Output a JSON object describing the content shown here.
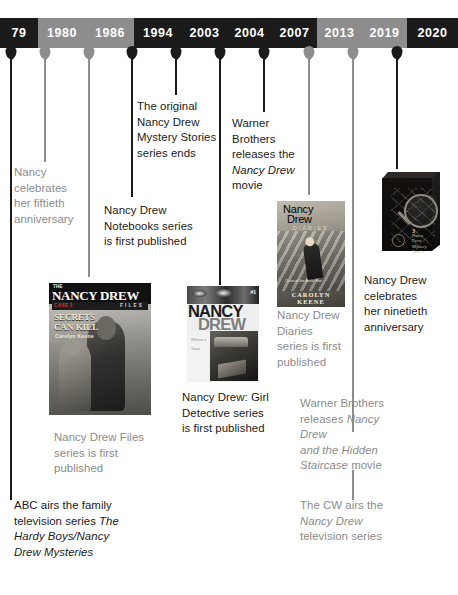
{
  "timeline": {
    "years": [
      {
        "label": "79",
        "style": "dark",
        "width": 38
      },
      {
        "label": "1980",
        "style": "gray",
        "width": 48
      },
      {
        "label": "1986",
        "style": "gray",
        "width": 48
      },
      {
        "label": "1994",
        "style": "dark",
        "width": 48
      },
      {
        "label": "2003",
        "style": "dark",
        "width": 45
      },
      {
        "label": "2004",
        "style": "dark",
        "width": 45
      },
      {
        "label": "2007",
        "style": "dark",
        "width": 45
      },
      {
        "label": "2013",
        "style": "gray",
        "width": 45
      },
      {
        "label": "2019",
        "style": "gray",
        "width": 45
      },
      {
        "label": "2020",
        "style": "dark",
        "width": 51
      }
    ],
    "markers": [
      {
        "year": "79",
        "x": 11,
        "style": "dark",
        "line_length": 443
      },
      {
        "year": "1980",
        "x": 45,
        "style": "gray",
        "line_length": 105
      },
      {
        "year": "1986",
        "x": 89,
        "style": "gray",
        "line_length": 220
      },
      {
        "year": "1994",
        "x": 132,
        "style": "dark",
        "line_length": 140
      },
      {
        "year": "2003",
        "x": 176,
        "style": "dark",
        "line_length": 38
      },
      {
        "year": "2004",
        "x": 220,
        "style": "dark",
        "line_length": 228
      },
      {
        "year": "2007",
        "x": 264,
        "style": "dark",
        "line_length": 55
      },
      {
        "year": "2013",
        "x": 309,
        "style": "gray",
        "line_length": 138
      },
      {
        "year": "2019",
        "x": 353,
        "style": "gray",
        "line_length": 375
      },
      {
        "year": "2020",
        "x": 397,
        "style": "dark",
        "line_length": 112
      }
    ]
  },
  "events": [
    {
      "id": "1979-abc",
      "year": "79",
      "style": "dark",
      "lines": [
        [
          {
            "t": "ABC airs the family"
          }
        ],
        [
          {
            "t": "television series "
          },
          {
            "t": "The",
            "i": true
          }
        ],
        [
          {
            "t": "Hardy Boys/Nancy",
            "i": true
          }
        ],
        [
          {
            "t": "Drew Mysteries",
            "i": true
          }
        ]
      ]
    },
    {
      "id": "1980-fiftieth",
      "year": "1980",
      "style": "gray",
      "lines": [
        [
          {
            "t": "Nancy"
          }
        ],
        [
          {
            "t": "celebrates"
          }
        ],
        [
          {
            "t": "her fiftieth"
          }
        ],
        [
          {
            "t": "anniversary"
          }
        ]
      ]
    },
    {
      "id": "1986-files",
      "year": "1986",
      "style": "gray",
      "lines": [
        [
          {
            "t": "Nancy Drew Files"
          }
        ],
        [
          {
            "t": "series is first"
          }
        ],
        [
          {
            "t": "published"
          }
        ]
      ]
    },
    {
      "id": "1994-notebooks",
      "year": "1994",
      "style": "dark",
      "lines": [
        [
          {
            "t": "Nancy Drew"
          }
        ],
        [
          {
            "t": "Notebooks series"
          }
        ],
        [
          {
            "t": "is first published"
          }
        ]
      ]
    },
    {
      "id": "2003-mystery-stories-end",
      "year": "2003",
      "style": "dark",
      "lines": [
        [
          {
            "t": "The original"
          }
        ],
        [
          {
            "t": "Nancy Drew"
          }
        ],
        [
          {
            "t": "Mystery Stories"
          }
        ],
        [
          {
            "t": "series ends"
          }
        ]
      ]
    },
    {
      "id": "2004-girl-detective",
      "year": "2004",
      "style": "dark",
      "lines": [
        [
          {
            "t": "Nancy Drew: Girl"
          }
        ],
        [
          {
            "t": "Detective series"
          }
        ],
        [
          {
            "t": "is first published"
          }
        ]
      ]
    },
    {
      "id": "2007-warner-movie",
      "year": "2007",
      "style": "dark",
      "lines": [
        [
          {
            "t": "Warner"
          }
        ],
        [
          {
            "t": "Brothers"
          }
        ],
        [
          {
            "t": "releases the"
          }
        ],
        [
          {
            "t": "Nancy Drew",
            "i": true
          }
        ],
        [
          {
            "t": "movie"
          }
        ]
      ]
    },
    {
      "id": "2013-diaries",
      "year": "2013",
      "style": "gray",
      "lines": [
        [
          {
            "t": "Nancy Drew"
          }
        ],
        [
          {
            "t": "Diaries"
          }
        ],
        [
          {
            "t": "series is first"
          }
        ],
        [
          {
            "t": "published"
          }
        ]
      ]
    },
    {
      "id": "2019-hidden-staircase",
      "year": "2019",
      "style": "gray",
      "lines": [
        [
          {
            "t": "Warner Brothers"
          }
        ],
        [
          {
            "t": "releases "
          },
          {
            "t": "Nancy Drew",
            "i": true
          }
        ],
        [
          {
            "t": "and the Hidden",
            "i": true
          }
        ],
        [
          {
            "t": "Staircase",
            "i": true
          },
          {
            "t": " movie"
          }
        ]
      ]
    },
    {
      "id": "2019-cw-series",
      "year": "2019",
      "style": "gray",
      "lines": [
        [
          {
            "t": "The CW airs the"
          }
        ],
        [
          {
            "t": "Nancy Drew",
            "i": true
          }
        ],
        [
          {
            "t": "television series"
          }
        ]
      ]
    },
    {
      "id": "2020-ninetieth",
      "year": "2020",
      "style": "dark",
      "lines": [
        [
          {
            "t": "Nancy Drew"
          }
        ],
        [
          {
            "t": "celebrates"
          }
        ],
        [
          {
            "t": "her ninetieth"
          }
        ],
        [
          {
            "t": "anniversary"
          }
        ]
      ]
    }
  ],
  "covers": {
    "files": {
      "the": "THE",
      "title": "NANCY DREW",
      "imprint": "FILES",
      "series_word": "CASE 1",
      "headline_1": "SECRETS",
      "headline_2": "CAN KILL",
      "author": "Carolyn Keene"
    },
    "girl_detective": {
      "number": "#1",
      "title_1": "NANCY",
      "title_2": "DREW",
      "side_text": "Without a Trace"
    },
    "diaries": {
      "title_1": "Nancy",
      "title_2": "Drew",
      "title_3": "DIARIES",
      "blurb": "Curse of the Arctic Star",
      "author": "CAROLYN KEENE"
    },
    "boxed_set": {
      "number": "3",
      "label_1": "Nancy Drew",
      "label_2": "Mystery Stories"
    }
  },
  "colors": {
    "dark": "#1b1b1b",
    "gray": "#8d8d8d",
    "text_dark": "#1a1a1a",
    "text_gray": "#8b8b8b",
    "background": "#ffffff"
  }
}
